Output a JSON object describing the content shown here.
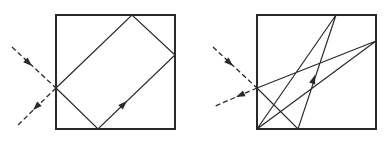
{
  "colors": {
    "background": "#ffffff",
    "stroke": "#2a2a2a"
  },
  "figures": [
    {
      "name": "left-figure",
      "box": {
        "x": 56,
        "y": 15,
        "w": 119,
        "h": 114
      },
      "path": [
        [
          56,
          88
        ],
        [
          98,
          129
        ],
        [
          175,
          55
        ],
        [
          132,
          15
        ],
        [
          56,
          88
        ]
      ],
      "incoming": {
        "from": [
          12,
          47
        ],
        "to": [
          56,
          88
        ],
        "arrow_at": [
          32,
          66
        ]
      },
      "outgoing": {
        "from": [
          56,
          88
        ],
        "to": [
          17,
          126
        ],
        "arrow_at": [
          33,
          110
        ]
      },
      "inner_arrow": {
        "at": [
          127,
          101
        ],
        "dir": [
          1,
          -0.96
        ]
      }
    },
    {
      "name": "right-figure",
      "box": {
        "x": 257,
        "y": 15,
        "w": 119,
        "h": 114
      },
      "path": [
        [
          257,
          88
        ],
        [
          298,
          129
        ],
        [
          336,
          15
        ],
        [
          257,
          129
        ],
        [
          376,
          41
        ],
        [
          257,
          88
        ]
      ],
      "incoming": {
        "from": [
          213,
          47
        ],
        "to": [
          257,
          88
        ],
        "arrow_at": [
          233,
          66
        ]
      },
      "outgoing": {
        "from": [
          257,
          88
        ],
        "to": [
          213,
          107
        ],
        "arrow_at": [
          236,
          97
        ]
      },
      "inner_arrow": {
        "at": [
          315,
          75
        ],
        "dir": [
          0.33,
          -1
        ]
      }
    }
  ]
}
